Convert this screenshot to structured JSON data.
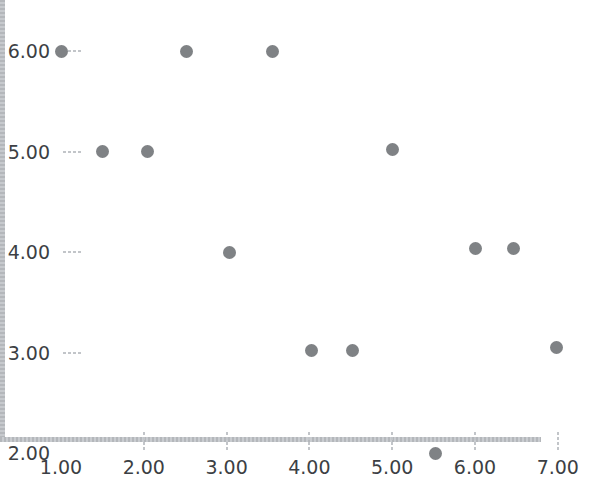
{
  "chart_data": {
    "type": "scatter",
    "title": "",
    "xlabel": "",
    "ylabel": "",
    "xlim": [
      1.0,
      7.53
    ],
    "ylim": [
      2.0,
      6.2
    ],
    "grid": false,
    "legend": null,
    "marker_color": "#7f8285",
    "axis_color": "#b9bcc0",
    "tick_label_color": "#3c3f44",
    "background_color": "#ffffff",
    "x_ticks": [
      1.0,
      2.0,
      3.0,
      4.0,
      5.0,
      6.0,
      7.0
    ],
    "x_tick_labels": [
      "1.00",
      "2.00",
      "3.00",
      "4.00",
      "5.00",
      "6.00",
      "7.00"
    ],
    "y_ticks": [
      2.0,
      3.0,
      4.0,
      5.0,
      6.0
    ],
    "y_tick_labels": [
      "2.00",
      "3.00",
      "4.00",
      "5.00",
      "6.00"
    ],
    "points": [
      {
        "x": 1.0,
        "y": 6.0
      },
      {
        "x": 2.52,
        "y": 6.0
      },
      {
        "x": 3.55,
        "y": 6.0
      },
      {
        "x": 1.5,
        "y": 5.0
      },
      {
        "x": 2.05,
        "y": 5.0
      },
      {
        "x": 5.0,
        "y": 5.02
      },
      {
        "x": 3.04,
        "y": 4.0
      },
      {
        "x": 6.01,
        "y": 4.03
      },
      {
        "x": 6.46,
        "y": 4.03
      },
      {
        "x": 4.03,
        "y": 3.02
      },
      {
        "x": 4.52,
        "y": 3.02
      },
      {
        "x": 6.99,
        "y": 3.05
      },
      {
        "x": 5.52,
        "y": 2.0
      }
    ]
  }
}
